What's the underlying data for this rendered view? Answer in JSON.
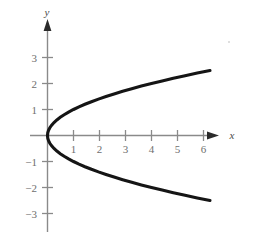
{
  "figure": {
    "title": "",
    "background_color": "#ffffff",
    "axis_color": "#8a8a8a",
    "curve_color": "#151515",
    "tick_label_color": "#6e6e6e",
    "axis_label_color": "#4a4a4a"
  },
  "axes": {
    "x_label": "x",
    "y_label": "y",
    "x_ticks": [
      "1",
      "2",
      "3",
      "4",
      "5",
      "6"
    ],
    "y_ticks": [
      "3",
      "2",
      "1",
      "−1",
      "−2",
      "−3"
    ],
    "x_arrow": "arrow-right",
    "y_arrow": "arrow-up"
  },
  "chart_data": {
    "type": "line",
    "title": "",
    "xlabel": "x",
    "ylabel": "y",
    "grid": false,
    "legend": null,
    "equation": "x = y^2",
    "orientation": "opens-right",
    "vertex": [
      0,
      0
    ],
    "xlim": [
      -0.6,
      6.9
    ],
    "ylim": [
      -3.6,
      3.4
    ],
    "xticks": [
      1,
      2,
      3,
      4,
      5,
      6
    ],
    "yticks": [
      -3,
      -2,
      -1,
      1,
      2,
      3
    ],
    "series": [
      {
        "name": "x = y^2",
        "x": [
          6.25,
          5.76,
          5.29,
          4.84,
          4.41,
          4.0,
          3.61,
          3.24,
          2.89,
          2.56,
          2.25,
          1.96,
          1.69,
          1.44,
          1.21,
          1.0,
          0.81,
          0.64,
          0.49,
          0.36,
          0.25,
          0.16,
          0.09,
          0.04,
          0.01,
          0.0,
          0.01,
          0.04,
          0.09,
          0.16,
          0.25,
          0.36,
          0.49,
          0.64,
          0.81,
          1.0,
          1.21,
          1.44,
          1.69,
          1.96,
          2.25,
          2.56,
          2.89,
          3.24,
          3.61,
          4.0,
          4.41,
          4.84,
          5.29,
          5.76,
          6.25
        ],
        "y": [
          2.5,
          2.4,
          2.3,
          2.2,
          2.1,
          2.0,
          1.9,
          1.8,
          1.7,
          1.6,
          1.5,
          1.4,
          1.3,
          1.2,
          1.1,
          1.0,
          0.9,
          0.8,
          0.7,
          0.6,
          0.5,
          0.4,
          0.3,
          0.2,
          0.1,
          0.0,
          -0.1,
          -0.2,
          -0.3,
          -0.4,
          -0.5,
          -0.6,
          -0.7,
          -0.8,
          -0.9,
          -1.0,
          -1.1,
          -1.2,
          -1.3,
          -1.4,
          -1.5,
          -1.6,
          -1.7,
          -1.8,
          -1.9,
          -2.0,
          -2.1,
          -2.2,
          -2.3,
          -2.4,
          -2.5
        ]
      }
    ],
    "endpoints": [
      [
        6.25,
        2.5
      ],
      [
        6.25,
        -2.5
      ]
    ]
  }
}
